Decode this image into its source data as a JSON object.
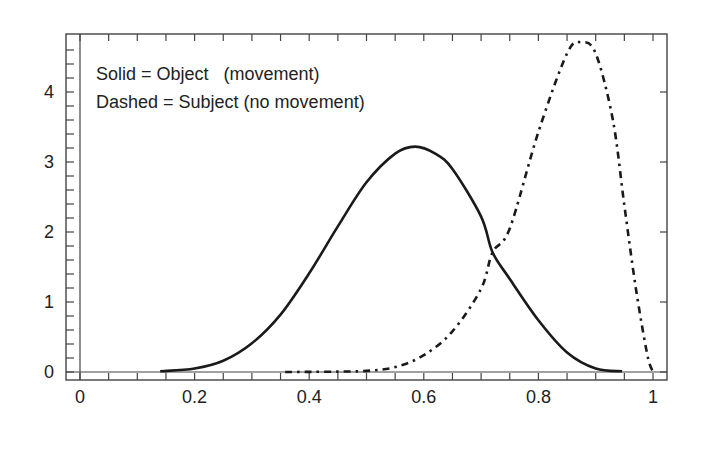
{
  "chart_data": {
    "type": "line",
    "title": "",
    "xlabel": "",
    "ylabel": "",
    "xlim": [
      -0.02,
      1.02
    ],
    "ylim": [
      -0.1,
      4.75
    ],
    "grid": false,
    "x_ticks": [
      0,
      0.2,
      0.4,
      0.6,
      0.8,
      1
    ],
    "x_tick_labels": [
      "0",
      "0.2",
      "0.4",
      "0.6",
      "0.8",
      "1"
    ],
    "y_ticks": [
      0,
      1,
      2,
      3,
      4
    ],
    "y_tick_labels": [
      "0",
      "1",
      "2",
      "3",
      "4"
    ],
    "annotations": [
      "Solid = Object   (movement)",
      "Dashed = Subject (no movement)"
    ],
    "series": [
      {
        "name": "Object (movement)",
        "style": "solid",
        "color": "#1a1a1a",
        "x": [
          0.14,
          0.2,
          0.25,
          0.3,
          0.35,
          0.4,
          0.45,
          0.5,
          0.55,
          0.585,
          0.62,
          0.65,
          0.7,
          0.72,
          0.75,
          0.8,
          0.85,
          0.9,
          0.946
        ],
        "y": [
          0.01,
          0.05,
          0.16,
          0.41,
          0.82,
          1.41,
          2.08,
          2.71,
          3.12,
          3.22,
          3.12,
          2.9,
          2.22,
          1.71,
          1.33,
          0.74,
          0.28,
          0.05,
          0.01
        ]
      },
      {
        "name": "Subject (no movement)",
        "style": "dash-dot",
        "color": "#1a1a1a",
        "x": [
          0.358,
          0.4,
          0.45,
          0.5,
          0.55,
          0.6,
          0.65,
          0.7,
          0.72,
          0.75,
          0.8,
          0.85,
          0.875,
          0.9,
          0.93,
          0.95,
          0.97,
          0.99,
          1.0
        ],
        "y": [
          0.0,
          0.002,
          0.006,
          0.016,
          0.07,
          0.24,
          0.58,
          1.19,
          1.71,
          2.05,
          3.43,
          4.55,
          4.71,
          4.55,
          3.6,
          2.38,
          1.2,
          0.25,
          0.0
        ]
      }
    ]
  },
  "legend": {
    "line1": "Solid = Object   (movement)",
    "line2": "Dashed = Subject (no movement)"
  }
}
